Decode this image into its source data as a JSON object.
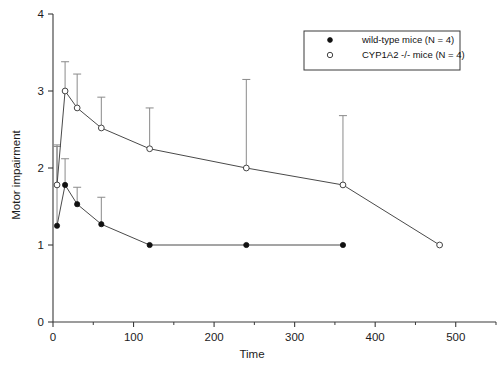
{
  "chart_data": {
    "type": "line",
    "title": "",
    "xlabel": "Time",
    "ylabel": "Motor impairment",
    "xlim": [
      0,
      550
    ],
    "ylim": [
      0,
      4
    ],
    "grid": false,
    "legend_position": "top-right",
    "x_ticks": [
      0,
      100,
      200,
      300,
      400,
      500
    ],
    "x_tick_labels": [
      "0",
      "100",
      "200",
      "300",
      "400",
      "500"
    ],
    "x_minor_ticks": [
      50,
      150,
      250,
      350,
      450,
      550
    ],
    "y_ticks": [
      0,
      1,
      2,
      3,
      4
    ],
    "y_tick_labels": [
      "0",
      "1",
      "2",
      "3",
      "4"
    ],
    "series": [
      {
        "name": "wild-type mice (N = 4)",
        "marker": "filled-circle",
        "x": [
          5,
          15,
          30,
          60,
          120,
          240,
          360
        ],
        "values": [
          1.25,
          1.78,
          1.53,
          1.27,
          1.0,
          1.0,
          1.0
        ],
        "error_upper": [
          2.28,
          2.12,
          1.75,
          1.62,
          null,
          null,
          null
        ]
      },
      {
        "name": "CYP1A2 -/- mice (N = 4)",
        "marker": "open-circle",
        "x": [
          5,
          15,
          30,
          60,
          120,
          240,
          360,
          480
        ],
        "values": [
          1.78,
          3.0,
          2.78,
          2.52,
          2.25,
          2.0,
          1.78,
          1.0
        ],
        "error_upper": [
          2.3,
          3.38,
          3.22,
          2.92,
          2.78,
          3.15,
          2.68,
          null
        ]
      }
    ]
  },
  "legend": {
    "entries": [
      {
        "label": "wild-type mice (N = 4)",
        "marker": "filled-circle"
      },
      {
        "label": "CYP1A2 -/- mice (N = 4)",
        "marker": "open-circle"
      }
    ]
  },
  "axes": {
    "x_title": "Time",
    "y_title": "Motor impairment"
  }
}
